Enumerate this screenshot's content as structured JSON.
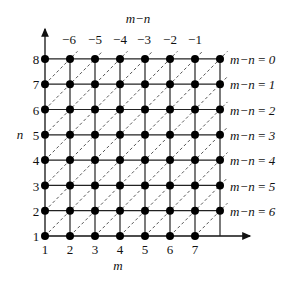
{
  "diagram": {
    "title_top": "m−n",
    "x_axis_label": "m",
    "y_axis_label": "n",
    "x_ticks": [
      "1",
      "2",
      "3",
      "4",
      "5",
      "6",
      "7"
    ],
    "y_ticks": [
      "1",
      "2",
      "3",
      "4",
      "5",
      "6",
      "7",
      "8"
    ],
    "top_ticks": [
      "−6",
      "−5",
      "−4",
      "−3",
      "−2",
      "−1"
    ],
    "right_labels": [
      "m−n = 0",
      "m−n = 1",
      "m−n = 2",
      "m−n = 3",
      "m−n = 4",
      "m−n = 5",
      "m−n = 6"
    ],
    "grid": {
      "columns": 8,
      "rows": 8
    }
  }
}
